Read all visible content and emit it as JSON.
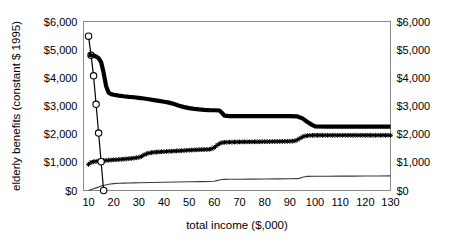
{
  "chart_data": {
    "type": "line",
    "title": "",
    "xlabel": "total income ($,000)",
    "ylabel": "elderly benefits (constant $ 1995)",
    "ylabel_right": "elderly benefits (constant $ 1995)",
    "xlim": [
      8,
      130
    ],
    "ylim": [
      0,
      6000
    ],
    "xticks": [
      10,
      20,
      30,
      40,
      50,
      60,
      70,
      80,
      90,
      100,
      110,
      120,
      130
    ],
    "xtick_labels": [
      "10",
      "20",
      "30",
      "40",
      "50",
      "60",
      "70",
      "80",
      "90",
      "100",
      "110",
      "120",
      "130"
    ],
    "yticks": [
      0,
      1000,
      2000,
      3000,
      4000,
      5000,
      6000
    ],
    "ytick_labels": [
      "$0",
      "$1,000",
      "$2,000",
      "$3,000",
      "$4,000",
      "$5,000",
      "$6,000"
    ],
    "ytick_labels_right": [
      "$0",
      "$1,000",
      "$2,000",
      "$3,000",
      "$4,000",
      "$5,000",
      "$6,000"
    ],
    "grid": false,
    "legend": "none",
    "series": [
      {
        "name": "thick-declining-benefits",
        "style": "thick-line",
        "marker": "none",
        "color": "#000000",
        "x": [
          10,
          11,
          12,
          13,
          14,
          15,
          16,
          17,
          18,
          19,
          20,
          22,
          24,
          26,
          28,
          30,
          32,
          34,
          36,
          38,
          40,
          42,
          44,
          46,
          48,
          50,
          52,
          54,
          56,
          58,
          60,
          62,
          63,
          64,
          66,
          70,
          75,
          80,
          85,
          90,
          93,
          95,
          97,
          99,
          100,
          105,
          110,
          115,
          120,
          125,
          130
        ],
        "y": [
          4820,
          4800,
          4790,
          4760,
          4700,
          4560,
          4180,
          3700,
          3470,
          3420,
          3400,
          3370,
          3345,
          3325,
          3310,
          3290,
          3265,
          3240,
          3210,
          3180,
          3150,
          3120,
          3070,
          3010,
          2960,
          2925,
          2900,
          2880,
          2865,
          2855,
          2850,
          2840,
          2760,
          2660,
          2640,
          2640,
          2640,
          2640,
          2640,
          2640,
          2630,
          2560,
          2430,
          2320,
          2280,
          2270,
          2270,
          2270,
          2270,
          2270,
          2270
        ]
      },
      {
        "name": "star-rising-benefits",
        "style": "star-line",
        "marker": "star",
        "color": "#000000",
        "x": [
          10,
          11,
          12,
          13,
          14,
          15,
          16,
          18,
          20,
          22,
          24,
          26,
          28,
          30,
          31,
          32,
          33,
          34,
          35,
          36,
          38,
          40,
          42,
          44,
          46,
          48,
          50,
          52,
          54,
          56,
          58,
          59,
          60,
          61,
          62,
          63,
          64,
          66,
          68,
          70,
          75,
          80,
          85,
          90,
          92,
          93,
          94,
          95,
          96,
          97,
          98,
          100,
          105,
          110,
          115,
          120,
          125,
          130
        ],
        "y": [
          930,
          1000,
          1020,
          1035,
          1045,
          1055,
          1060,
          1075,
          1090,
          1100,
          1115,
          1130,
          1150,
          1175,
          1210,
          1260,
          1300,
          1330,
          1345,
          1355,
          1370,
          1380,
          1390,
          1400,
          1410,
          1420,
          1430,
          1440,
          1450,
          1455,
          1460,
          1480,
          1530,
          1600,
          1660,
          1700,
          1710,
          1715,
          1720,
          1725,
          1730,
          1735,
          1740,
          1745,
          1760,
          1800,
          1850,
          1900,
          1935,
          1950,
          1955,
          1960,
          1960,
          1960,
          1960,
          1960,
          1960,
          1960
        ]
      },
      {
        "name": "thin-low-benefits",
        "style": "thin-line",
        "marker": "none",
        "color": "#3a3a3a",
        "x": [
          10,
          12,
          14,
          15,
          16,
          18,
          20,
          22,
          24,
          26,
          28,
          30,
          35,
          40,
          45,
          50,
          55,
          58,
          60,
          61,
          62,
          63,
          64,
          66,
          70,
          75,
          80,
          85,
          90,
          93,
          94,
          95,
          96,
          97,
          100,
          105,
          110,
          115,
          120,
          125,
          130
        ],
        "y": [
          0,
          60,
          120,
          160,
          180,
          220,
          245,
          255,
          262,
          268,
          272,
          276,
          285,
          292,
          300,
          308,
          316,
          322,
          330,
          350,
          372,
          388,
          395,
          398,
          400,
          404,
          408,
          412,
          416,
          420,
          440,
          468,
          490,
          500,
          505,
          508,
          510,
          512,
          514,
          516,
          518
        ]
      },
      {
        "name": "circle-steep-decline",
        "style": "circle-line",
        "marker": "circle",
        "color": "#000000",
        "x": [
          10,
          11,
          12,
          13,
          14,
          15,
          16
        ],
        "y": [
          5480,
          4800,
          4070,
          3060,
          2040,
          1020,
          0
        ]
      }
    ]
  }
}
